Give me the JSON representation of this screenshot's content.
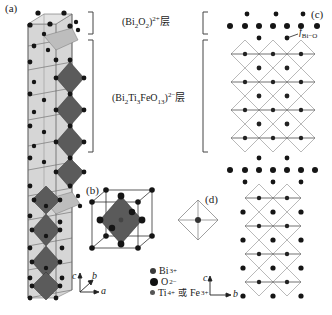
{
  "figure": {
    "panels": {
      "a": "(a)",
      "b": "(b)",
      "c": "(c)",
      "d": "(d)"
    },
    "layers": {
      "bi2o2": {
        "prefix": "(Bi",
        "sub1": "2",
        "mid": "O",
        "sub2": "2",
        "close": ")",
        "charge": "2+",
        "suffix": "层"
      },
      "perovskite": {
        "prefix": "(Bi",
        "sub1": "2",
        "ti": "Ti",
        "sub2": "3",
        "rest": "FeO",
        "sub3": "13",
        "close": ")",
        "charge": "2−",
        "suffix": "层"
      }
    },
    "bond_label": {
      "f": "f",
      "sub": "Bi−O"
    },
    "legend": [
      {
        "symbol": "Bi",
        "charge": "3+",
        "size": "medium",
        "color": "#3a3a3a"
      },
      {
        "symbol": "O",
        "charge": "2−",
        "size": "large",
        "color": "#111111"
      },
      {
        "symbol": "Ti",
        "charge": "4+",
        "joiner": " 或 ",
        "symbol2": "Fe",
        "charge2": "3+",
        "size": "small",
        "color": "#555555"
      }
    ],
    "axes_a": {
      "c": "c",
      "b": "b",
      "a": "a"
    },
    "axes_c": {
      "c": "c",
      "b": "b"
    },
    "colors": {
      "octahedron": "#5a5a5a",
      "cell_fill": "#d4d4d4",
      "atom": "#151515",
      "line": "#555555"
    }
  }
}
